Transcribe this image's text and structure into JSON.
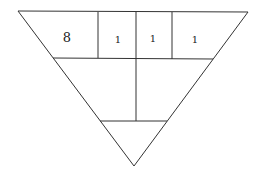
{
  "diagram": {
    "shape": "inverted-triangle",
    "stroke_color": "#333333",
    "background": "#ffffff",
    "cells": [
      {
        "id": "top-1",
        "label": "8"
      },
      {
        "id": "top-2",
        "label": "1"
      },
      {
        "id": "top-3",
        "label": "1"
      },
      {
        "id": "top-4",
        "label": "1"
      },
      {
        "id": "middle-left",
        "label": ""
      },
      {
        "id": "middle-right",
        "label": ""
      },
      {
        "id": "bottom",
        "label": ""
      }
    ]
  }
}
